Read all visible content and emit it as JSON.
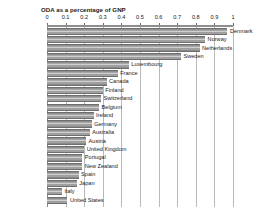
{
  "chart_data": {
    "type": "bar",
    "orientation": "horizontal",
    "title": "ODA as a percentage of GNP",
    "xlabel": "",
    "ylabel": "",
    "xlim": [
      0,
      1
    ],
    "grid": true,
    "legend": null,
    "tick_labels": [
      "0",
      "0.1",
      "0.2",
      "0.3",
      "0.4",
      "0.5",
      "0.6",
      "0.7",
      "0.8",
      "0.9",
      "1"
    ],
    "tick_values": [
      0,
      0.1,
      0.2,
      0.3,
      0.4,
      0.5,
      0.6,
      0.7,
      0.8,
      0.9,
      1
    ],
    "categories": [
      "Denmark",
      "Norway",
      "Netherlands",
      "Sweden",
      "Luxembourg",
      "France",
      "Canada",
      "Finland",
      "Switzerland",
      "Belgium",
      "Ireland",
      "Germany",
      "Australia",
      "Austria",
      "United Kingdom",
      "Portugal",
      "New Zealand",
      "Spain",
      "Japan",
      "Italy",
      "United States"
    ],
    "values": [
      0.97,
      0.85,
      0.82,
      0.72,
      0.44,
      0.38,
      0.32,
      0.3,
      0.29,
      0.28,
      0.25,
      0.24,
      0.23,
      0.21,
      0.2,
      0.19,
      0.19,
      0.17,
      0.16,
      0.08,
      0.11
    ],
    "bar_color": "#9a9a9a",
    "grid_color": "#b9b9b9"
  }
}
